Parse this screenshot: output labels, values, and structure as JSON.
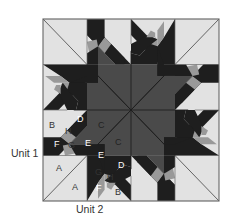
{
  "figure": {
    "type": "quilt-block-diagram",
    "unit_labels": [
      {
        "id": "unit1",
        "text": "Unit 1"
      },
      {
        "id": "unit2",
        "text": "Unit 2"
      }
    ],
    "piece_labels": {
      "unit1": [
        "B",
        "D",
        "H",
        "C",
        "F",
        "G",
        "E",
        "A"
      ],
      "unit2": [
        "C",
        "E",
        "D",
        "G",
        "H",
        "F",
        "B",
        "A"
      ]
    },
    "colors": {
      "background": "#e6e6e6",
      "light": "#e2e2e2",
      "medium": "#999999",
      "dark_gray": "#4a4a4a",
      "darkest": "#1e1e1e",
      "lines": "#555555"
    }
  },
  "labels": {
    "unit1": "Unit 1",
    "unit2": "Unit 2",
    "u1_B": "B",
    "u1_D": "D",
    "u1_H": "H",
    "u1_C": "C",
    "u1_F": "F",
    "u1_G": "G",
    "u1_E": "E",
    "u1_A": "A",
    "u2_C": "C",
    "u2_E": "E",
    "u2_D": "D",
    "u2_G": "G",
    "u2_H": "H",
    "u2_F": "F",
    "u2_B": "B",
    "u2_A": "A"
  }
}
